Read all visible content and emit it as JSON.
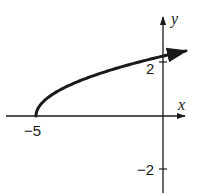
{
  "chart_data": {
    "type": "line",
    "title": "",
    "function": "y = sqrt(x + 5)",
    "xlabel": "x",
    "ylabel": "y",
    "x_ticks": [
      {
        "value": -5,
        "label": "−5"
      }
    ],
    "y_ticks": [
      {
        "value": 2,
        "label": "2"
      },
      {
        "value": -2,
        "label": "−2"
      }
    ],
    "xlim": [
      -6.2,
      0.9
    ],
    "ylim": [
      -2.9,
      3.7
    ],
    "grid": false,
    "legend": null,
    "series": [
      {
        "name": "y = sqrt(x + 5)",
        "start_point": {
          "x": -5,
          "y": 0
        },
        "end_arrow": true,
        "x": [
          -5,
          -4.9,
          -4.5,
          -4,
          -3,
          -2,
          -1,
          0,
          0.9
        ],
        "y": [
          0,
          0.32,
          0.71,
          1.0,
          1.41,
          1.73,
          2.0,
          2.24,
          2.43
        ]
      }
    ],
    "colors": {
      "stroke": "#1a1a1a",
      "background": "#ffffff"
    }
  }
}
